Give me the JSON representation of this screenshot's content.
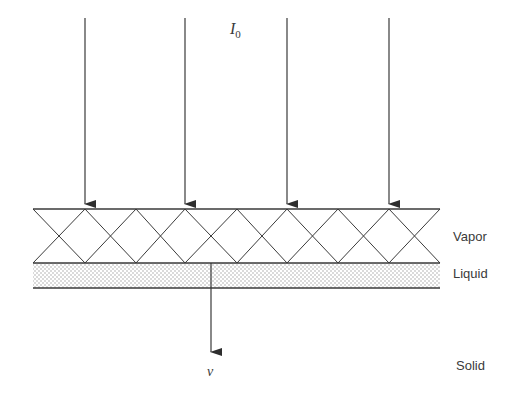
{
  "diagram": {
    "incident_label": "I",
    "incident_subscript": "0",
    "velocity_label": "v",
    "layers": {
      "vapor": "Vapor",
      "liquid": "Liquid",
      "solid": "Solid"
    },
    "colors": {
      "line": "#3a3a3a",
      "background": "#ffffff",
      "liquid_dot": "#9a9a9a"
    }
  }
}
